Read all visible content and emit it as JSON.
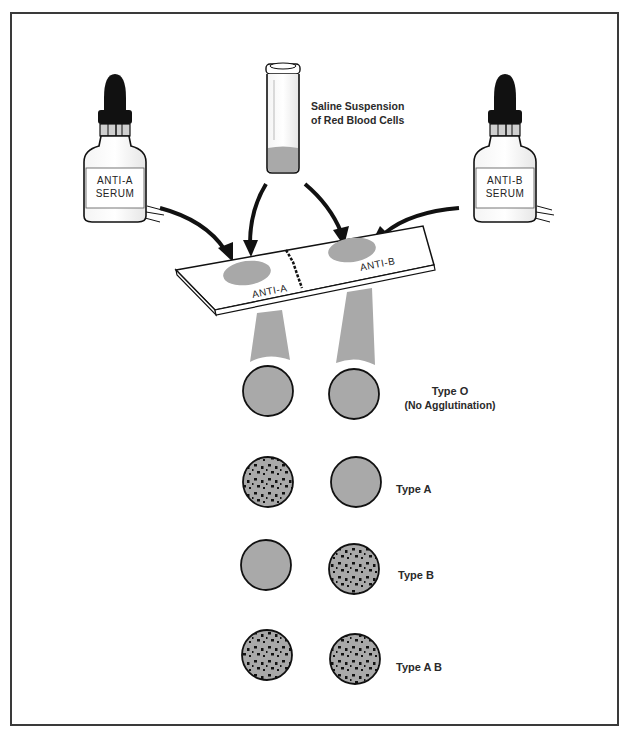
{
  "reagents": {
    "anti_a": {
      "line1": "ANTI-A",
      "line2": "SERUM"
    },
    "anti_b": {
      "line1": "ANTI-B",
      "line2": "SERUM"
    },
    "saline": {
      "line1": "Saline Suspension",
      "line2": "of Red Blood Cells"
    }
  },
  "slide": {
    "left_label": "ANTI-A",
    "right_label": "ANTI-B"
  },
  "colors": {
    "frame": "#3a3a3a",
    "ink": "#111111",
    "serum_gray": "#a8a8a8",
    "circle_gray": "#a9a9a9"
  },
  "results": [
    {
      "type": "Type O",
      "note": "(No Agglutination)",
      "anti_a_agglutinated": false,
      "anti_b_agglutinated": false
    },
    {
      "type": "Type A",
      "note": "",
      "anti_a_agglutinated": true,
      "anti_b_agglutinated": false
    },
    {
      "type": "Type B",
      "note": "",
      "anti_a_agglutinated": false,
      "anti_b_agglutinated": true
    },
    {
      "type": "Type A B",
      "note": "",
      "anti_a_agglutinated": true,
      "anti_b_agglutinated": true
    }
  ]
}
